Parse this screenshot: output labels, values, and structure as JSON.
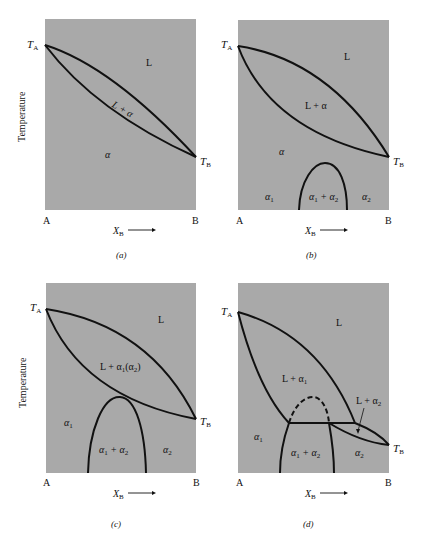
{
  "figure": {
    "y_axis_label": "Temperature",
    "colors": {
      "field": "#a9a9a9",
      "line": "#111111",
      "background": "#ffffff"
    },
    "panels": [
      {
        "id": "a",
        "caption": "(a)",
        "T_A": "T",
        "T_A_sub": "A",
        "T_B": "T",
        "T_B_sub": "B",
        "x_left": "A",
        "x_right": "B",
        "x_label": "X",
        "x_label_sub": "B",
        "regions": {
          "liquid": "L",
          "two_phase": "L + α",
          "solid": "α"
        }
      },
      {
        "id": "b",
        "caption": "(b)",
        "T_A": "T",
        "T_A_sub": "A",
        "T_B": "T",
        "T_B_sub": "B",
        "x_left": "A",
        "x_right": "B",
        "x_label": "X",
        "x_label_sub": "B",
        "regions": {
          "liquid": "L",
          "two_phase": "L + α",
          "solid": "α",
          "alpha1": "α",
          "alpha1_sub": "1",
          "miscibility": "α",
          "miscibility_sub1": "1",
          "miscibility_plus": " + α",
          "miscibility_sub2": "2",
          "alpha2": "α",
          "alpha2_sub": "2"
        }
      },
      {
        "id": "c",
        "caption": "(c)",
        "T_A": "T",
        "T_A_sub": "A",
        "T_B": "T",
        "T_B_sub": "B",
        "x_left": "A",
        "x_right": "B",
        "x_label": "X",
        "x_label_sub": "B",
        "regions": {
          "liquid": "L",
          "two_phase_pre": "L + α",
          "two_phase_sub1": "1",
          "two_phase_mid": "(α",
          "two_phase_sub2": "2",
          "two_phase_post": ")",
          "alpha1": "α",
          "alpha1_sub": "1",
          "miscibility": "α",
          "miscibility_sub1": "1",
          "miscibility_plus": " + α",
          "miscibility_sub2": "2",
          "alpha2": "α",
          "alpha2_sub": "2"
        }
      },
      {
        "id": "d",
        "caption": "(d)",
        "T_A": "T",
        "T_A_sub": "A",
        "T_B": "T",
        "T_B_sub": "B",
        "x_left": "A",
        "x_right": "B",
        "x_label": "X",
        "x_label_sub": "B",
        "regions": {
          "liquid": "L",
          "L_alpha1": "L + α",
          "L_alpha1_sub": "1",
          "L_alpha2": "L + α",
          "L_alpha2_sub": "2",
          "alpha1": "α",
          "alpha1_sub": "1",
          "miscibility": "α",
          "miscibility_sub1": "1",
          "miscibility_plus": " + α",
          "miscibility_sub2": "2",
          "alpha2": "α",
          "alpha2_sub": "2"
        }
      }
    ]
  }
}
